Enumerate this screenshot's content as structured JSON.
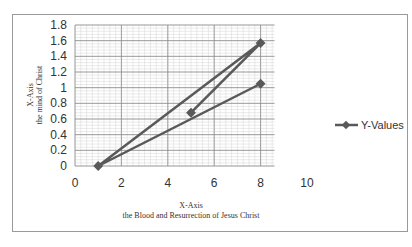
{
  "chart_data": {
    "type": "scatter",
    "title": "",
    "xlabel": "X-Axis",
    "xlabel_sub": "the Blood and Resurrection of Jesus Christ",
    "ylabel": "X-Axis",
    "ylabel_sub": "the mind of Christ",
    "xlim": [
      0,
      10
    ],
    "ylim": [
      0,
      1.8
    ],
    "x_ticks": [
      "0",
      "2",
      "4",
      "6",
      "8",
      "10"
    ],
    "y_ticks": [
      "0",
      "0.2",
      "0.4",
      "0.6",
      "0.8",
      "1",
      "1.2",
      "1.4",
      "1.6",
      "1.8"
    ],
    "grid": true,
    "legend_position": "right",
    "series": [
      {
        "name": "Y-Values",
        "color": "#595959",
        "marker": "diamond",
        "line": true,
        "x": [
          5,
          8,
          1,
          8
        ],
        "y": [
          0.68,
          1.57,
          0,
          1.05
        ]
      }
    ]
  }
}
